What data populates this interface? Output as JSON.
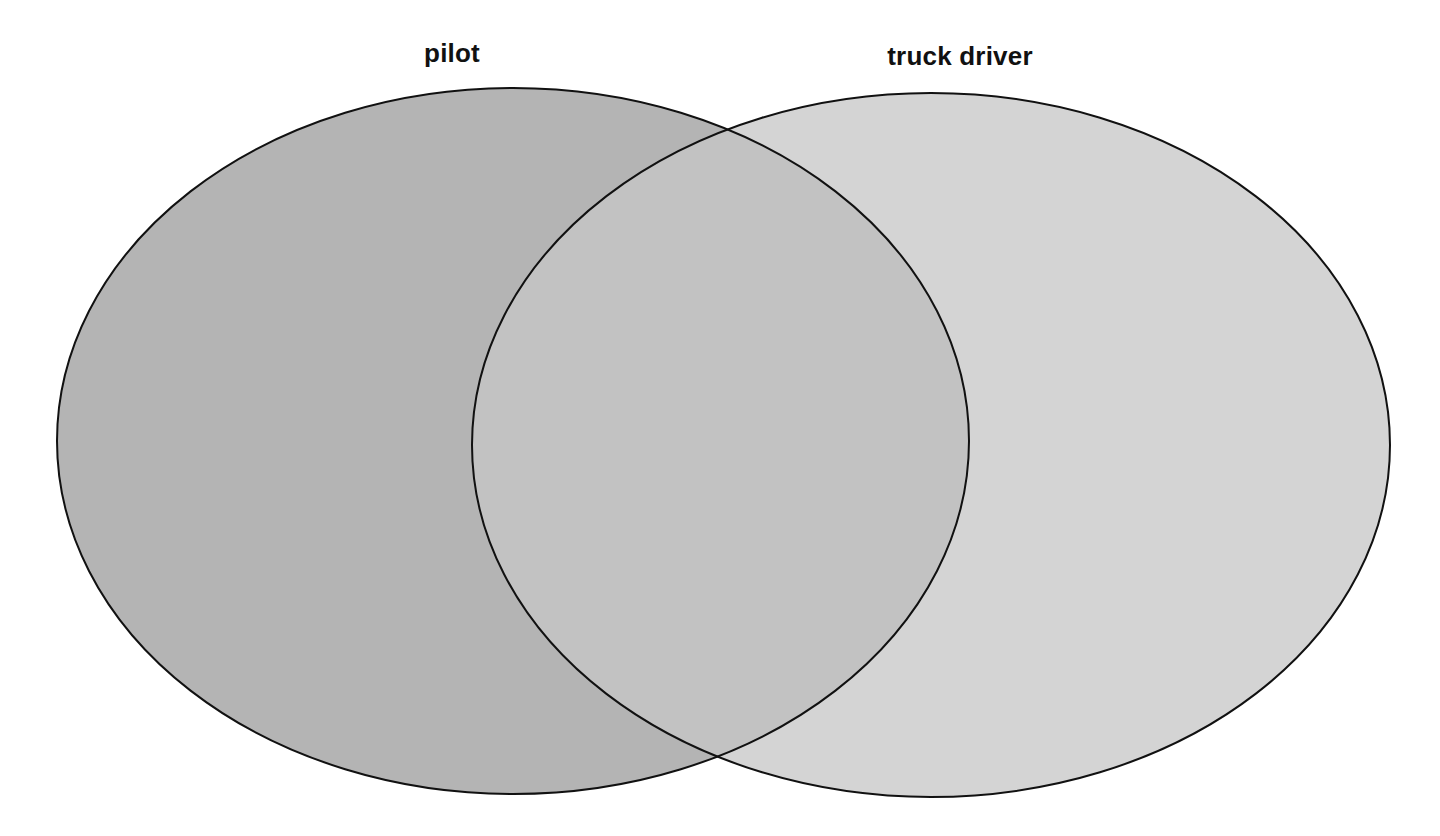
{
  "diagram": {
    "type": "venn",
    "sets": [
      {
        "id": "left",
        "label": "pilot",
        "fill": "#b4b4b4",
        "stroke": "#111111",
        "ellipse": {
          "cx": 513,
          "cy": 441,
          "rx": 456,
          "ry": 353
        },
        "label_pos": {
          "x": 452,
          "y": 38
        }
      },
      {
        "id": "right",
        "label": "truck driver",
        "fill": "#d4d4d4",
        "stroke": "#111111",
        "ellipse": {
          "cx": 931,
          "cy": 445,
          "rx": 459,
          "ry": 352
        },
        "label_pos": {
          "x": 960,
          "y": 41
        }
      }
    ],
    "overlap_fill": "#c2c2c2",
    "background": "#ffffff"
  }
}
